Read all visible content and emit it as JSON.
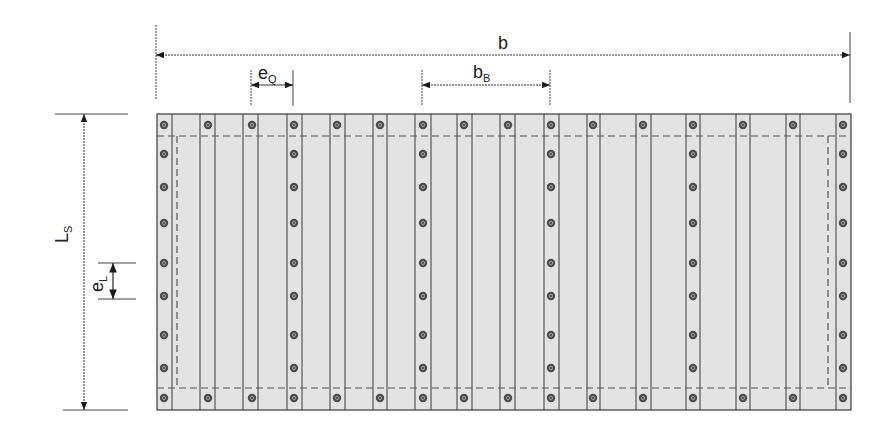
{
  "diagram": {
    "colors": {
      "panel_fill": "#e3e3e3",
      "line": "#3a3a3a",
      "dashed": "#555555",
      "bolt_fill": "#4a4a4a",
      "bolt_inner": "#9a9a9a",
      "text": "#222222"
    },
    "panel": {
      "x1": 157,
      "y1": 114,
      "x2": 851,
      "y2": 410
    },
    "inner_dashed": {
      "top_y": 136,
      "bottom_y": 388,
      "left_x": 177,
      "right_x": 828
    },
    "rib_lines_x": [
      172,
      200,
      215,
      243,
      258,
      287,
      302,
      330,
      345,
      373,
      387,
      415,
      431,
      457,
      472,
      500,
      515,
      544,
      559,
      587,
      600,
      636,
      651,
      686,
      700,
      736,
      750,
      786,
      800,
      836
    ],
    "edge_bolt_x": [
      164,
      208,
      252,
      294,
      337,
      380,
      423,
      464,
      508,
      551,
      593,
      643,
      693,
      743,
      793,
      843
    ],
    "edge_bolt_y": [
      125,
      398
    ],
    "column_bolt_x": [
      164,
      294,
      423,
      551,
      693,
      843
    ],
    "column_bolt_y": [
      154,
      187,
      223,
      263,
      296,
      335,
      368
    ],
    "dimensions": {
      "b": {
        "label": "b",
        "subscript": "",
        "x1": 156,
        "x2": 850,
        "y": 55,
        "ext_left": [
          25,
          100
        ],
        "ext_right": [
          32,
          103
        ],
        "text_x": 498,
        "text_y": 49
      },
      "e_Q": {
        "label": "e",
        "subscript": "Q",
        "x1": 251,
        "x2": 293,
        "y": 85,
        "ext": [
          70,
          106
        ],
        "text_x": 258,
        "text_y": 79
      },
      "b_B": {
        "label": "b",
        "subscript": "B",
        "x1": 422,
        "x2": 550,
        "y": 85,
        "ext": [
          70,
          106
        ],
        "text_x": 473,
        "text_y": 78
      },
      "L_S": {
        "label": "L",
        "subscript": "S",
        "x": 84,
        "y1": 114,
        "y2": 410,
        "ext": [
          55,
          128
        ],
        "text_x": 68,
        "text_y": 243
      },
      "e_L": {
        "label": "e",
        "subscript": "L",
        "x": 113,
        "y1": 263,
        "y2": 299,
        "ext": [
          98,
          136
        ],
        "text_x": 103,
        "text_y": 292
      }
    }
  }
}
